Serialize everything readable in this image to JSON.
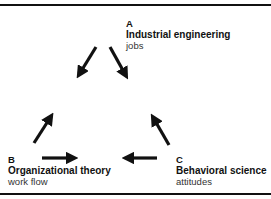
{
  "diagram": {
    "nodes": [
      {
        "id": "A",
        "letter": "A",
        "title": "Industrial engineering",
        "subtitle": "jobs"
      },
      {
        "id": "B",
        "letter": "B",
        "title": "Organizational theory",
        "subtitle": "work flow"
      },
      {
        "id": "C",
        "letter": "C",
        "title": "Behavioral science",
        "subtitle": "attitudes"
      }
    ],
    "edges": [
      {
        "from": "A",
        "to": "B"
      },
      {
        "from": "A",
        "to": "C"
      },
      {
        "from": "B",
        "to": "A"
      },
      {
        "from": "C",
        "to": "A"
      },
      {
        "from": "B",
        "to": "C"
      },
      {
        "from": "C",
        "to": "B"
      }
    ],
    "colors": {
      "line": "#111111",
      "background": "#ffffff"
    }
  }
}
